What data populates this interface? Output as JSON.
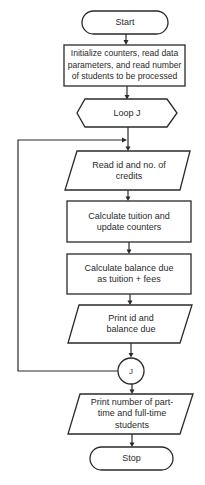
{
  "flowchart": {
    "nodes": [
      {
        "id": "start",
        "type": "terminal",
        "lines": [
          "Start"
        ]
      },
      {
        "id": "init",
        "type": "process",
        "lines": [
          "Initialize counters, read data",
          "parameters, and read number",
          "of students to be processed"
        ]
      },
      {
        "id": "loop",
        "type": "loop-hexagon",
        "lines": [
          "Loop J"
        ]
      },
      {
        "id": "read",
        "type": "input-output",
        "lines": [
          "Read id and no. of",
          "credits"
        ]
      },
      {
        "id": "calc_tuition",
        "type": "process",
        "lines": [
          "Calculate tuition and",
          "update counters"
        ]
      },
      {
        "id": "calc_balance",
        "type": "process",
        "lines": [
          "Calculate balance due",
          "as tuition + fees"
        ]
      },
      {
        "id": "print_id",
        "type": "input-output",
        "lines": [
          "Print id and",
          "balance due"
        ]
      },
      {
        "id": "connector",
        "type": "connector",
        "lines": [
          "J"
        ]
      },
      {
        "id": "print_counts",
        "type": "input-output",
        "lines": [
          "Print number of part-",
          "time and full-time",
          "students"
        ]
      },
      {
        "id": "stop",
        "type": "terminal",
        "lines": [
          "Stop"
        ]
      }
    ],
    "edges": [
      {
        "from": "start",
        "to": "init"
      },
      {
        "from": "init",
        "to": "loop"
      },
      {
        "from": "loop",
        "to": "read"
      },
      {
        "from": "read",
        "to": "calc_tuition"
      },
      {
        "from": "calc_tuition",
        "to": "calc_balance"
      },
      {
        "from": "calc_balance",
        "to": "print_id"
      },
      {
        "from": "print_id",
        "to": "connector"
      },
      {
        "from": "connector",
        "to": "read",
        "label": "loop back"
      },
      {
        "from": "connector",
        "to": "print_counts"
      },
      {
        "from": "print_counts",
        "to": "stop"
      }
    ]
  }
}
